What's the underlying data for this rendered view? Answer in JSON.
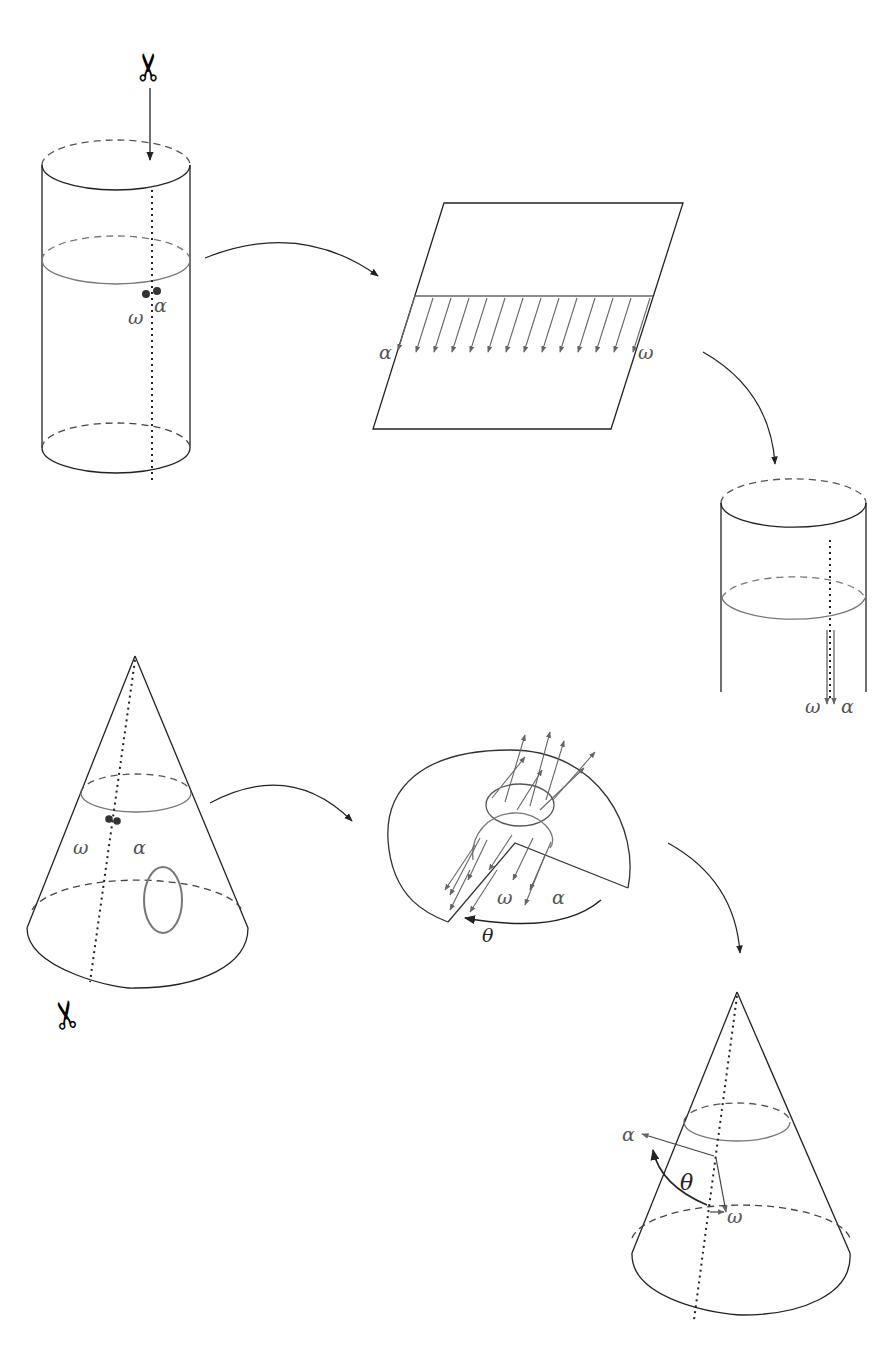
{
  "figure": {
    "colors": {
      "line": "#222222",
      "gray": "#777777",
      "dot": "#333333"
    }
  },
  "labels": {
    "cyl1_omega": "ω",
    "cyl1_alpha": "α",
    "plane_alpha": "α",
    "plane_omega": "ω",
    "cyl2_omega": "ω",
    "cyl2_alpha": "α",
    "cone1_omega": "ω",
    "cone1_alpha": "α",
    "flat_omega": "ω",
    "flat_alpha": "α",
    "flat_theta": "θ",
    "cone2_alpha": "α",
    "cone2_theta": "θ",
    "cone2_omega": "ω"
  },
  "icons": {
    "scissors_top": "✂",
    "scissors_bottom": "✂"
  }
}
